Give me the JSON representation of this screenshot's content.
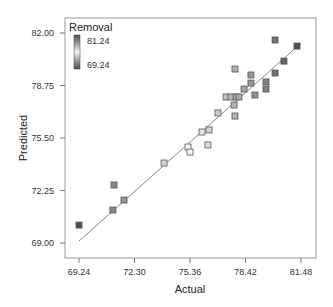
{
  "chart_data": {
    "type": "scatter",
    "title": "",
    "xlabel": "Actual",
    "ylabel": "Predicted",
    "xlim": [
      68.5,
      82.3
    ],
    "ylim": [
      68.3,
      82.9
    ],
    "x_ticks": [
      "69.24",
      "72.30",
      "75.36",
      "78.42",
      "81.48"
    ],
    "y_ticks": [
      "82.00",
      "78.75",
      "75.50",
      "72.25",
      "69.00"
    ],
    "grid": false,
    "legend": {
      "title": "Removal",
      "position": "top-left",
      "colorbar_max": "81.24",
      "colorbar_min": "69.24"
    },
    "fit_line": {
      "x": [
        69.24,
        81.48
      ],
      "y": [
        69.12,
        81.37
      ]
    },
    "series": [
      {
        "name": "Design points",
        "points": [
          {
            "x": 69.24,
            "y": 70.11
          },
          {
            "x": 71.11,
            "y": 71.04
          },
          {
            "x": 71.72,
            "y": 71.66
          },
          {
            "x": 71.17,
            "y": 72.59
          },
          {
            "x": 73.93,
            "y": 73.95
          },
          {
            "x": 75.25,
            "y": 74.94
          },
          {
            "x": 75.36,
            "y": 74.63
          },
          {
            "x": 76.35,
            "y": 75.07
          },
          {
            "x": 76.02,
            "y": 75.87
          },
          {
            "x": 76.41,
            "y": 76.0
          },
          {
            "x": 76.9,
            "y": 77.05
          },
          {
            "x": 77.84,
            "y": 76.86
          },
          {
            "x": 77.79,
            "y": 77.54
          },
          {
            "x": 77.35,
            "y": 78.04
          },
          {
            "x": 77.62,
            "y": 78.04
          },
          {
            "x": 77.9,
            "y": 78.04
          },
          {
            "x": 78.06,
            "y": 78.04
          },
          {
            "x": 78.34,
            "y": 78.53
          },
          {
            "x": 78.94,
            "y": 78.16
          },
          {
            "x": 78.72,
            "y": 78.9
          },
          {
            "x": 78.72,
            "y": 79.4
          },
          {
            "x": 77.84,
            "y": 79.77
          },
          {
            "x": 79.55,
            "y": 78.53
          },
          {
            "x": 79.55,
            "y": 78.97
          },
          {
            "x": 80.05,
            "y": 79.52
          },
          {
            "x": 80.54,
            "y": 80.26
          },
          {
            "x": 81.26,
            "y": 81.19
          },
          {
            "x": 80.05,
            "y": 81.57
          }
        ]
      }
    ]
  },
  "colors": {
    "axis": "#555555",
    "fit_line": "#888888",
    "marker_stroke": "#555555",
    "marker_high": "#555555",
    "marker_mid": "#ffffff",
    "marker_low": "#6a6a6a"
  }
}
